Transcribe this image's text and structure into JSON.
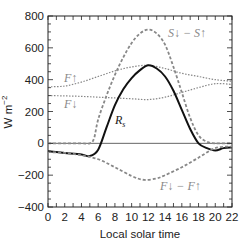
{
  "chart_data": {
    "type": "line",
    "title": "",
    "xlabel": "Local solar time",
    "ylabel": "W m-2",
    "xlim": [
      0,
      22
    ],
    "ylim": [
      -400,
      800
    ],
    "xticks": [
      0,
      2,
      4,
      6,
      8,
      10,
      12,
      14,
      16,
      18,
      20,
      22
    ],
    "yticks": [
      -400,
      -200,
      0,
      200,
      400,
      600,
      800
    ],
    "grid": false,
    "legend": "inline annotations",
    "series": [
      {
        "name": "S↓ − S↑",
        "style": "dashed-gray",
        "x": [
          0,
          2,
          4,
          5,
          5.5,
          6,
          7,
          8,
          9,
          10,
          11,
          12,
          13,
          14,
          15,
          16,
          17,
          18,
          19,
          20,
          22
        ],
        "values": [
          0,
          0,
          0,
          0,
          30,
          150,
          300,
          430,
          540,
          630,
          690,
          715,
          690,
          620,
          480,
          320,
          160,
          50,
          10,
          0,
          0
        ]
      },
      {
        "name": "F↑",
        "style": "dotted-gray",
        "x": [
          0,
          2,
          4,
          6,
          8,
          10,
          12,
          14,
          16,
          18,
          20,
          22
        ],
        "values": [
          355,
          360,
          385,
          420,
          455,
          480,
          490,
          470,
          440,
          420,
          400,
          390
        ]
      },
      {
        "name": "F↓",
        "style": "dotted-gray",
        "x": [
          0,
          2,
          4,
          6,
          8,
          10,
          12,
          14,
          16,
          18,
          20,
          22
        ],
        "values": [
          300,
          298,
          295,
          290,
          285,
          280,
          275,
          290,
          320,
          350,
          375,
          370
        ]
      },
      {
        "name": "Rs",
        "style": "solid-black",
        "x": [
          0,
          2,
          4,
          5,
          6,
          7,
          8,
          9,
          10,
          11,
          12,
          13,
          14,
          15,
          16,
          17,
          18,
          19,
          20,
          21,
          22
        ],
        "values": [
          -50,
          -60,
          -70,
          -80,
          -40,
          100,
          240,
          340,
          410,
          460,
          490,
          470,
          420,
          330,
          210,
          90,
          0,
          -30,
          -45,
          -30,
          -25
        ]
      },
      {
        "name": "F↓ − F↑",
        "style": "dashed-gray",
        "x": [
          0,
          2,
          4,
          6,
          8,
          10,
          11.5,
          13,
          14,
          16,
          18,
          20,
          22
        ],
        "values": [
          -55,
          -60,
          -75,
          -100,
          -150,
          -205,
          -230,
          -220,
          -200,
          -150,
          -90,
          -30,
          -20
        ]
      }
    ],
    "annotations": [
      {
        "text": "S↓ − S↑",
        "x": 14.5,
        "y": 680
      },
      {
        "text": "F↑",
        "x": 1.5,
        "y": 405
      },
      {
        "text": "F↓",
        "x": 1.5,
        "y": 255
      },
      {
        "text": "Rs",
        "x": 8.8,
        "y": 150
      },
      {
        "text": "F↓ − F↑",
        "x": 15.5,
        "y": -260
      }
    ]
  },
  "labels": {
    "xlabel": "Local solar time",
    "ylabel_main": "W m",
    "ylabel_sup": "−2",
    "ann_s": "S↓ − S↑",
    "ann_fup": "F↑",
    "ann_fdown": "F↓",
    "ann_rs": "R",
    "ann_rs_sub": "s",
    "ann_fnet": "F↓ − F↑"
  }
}
